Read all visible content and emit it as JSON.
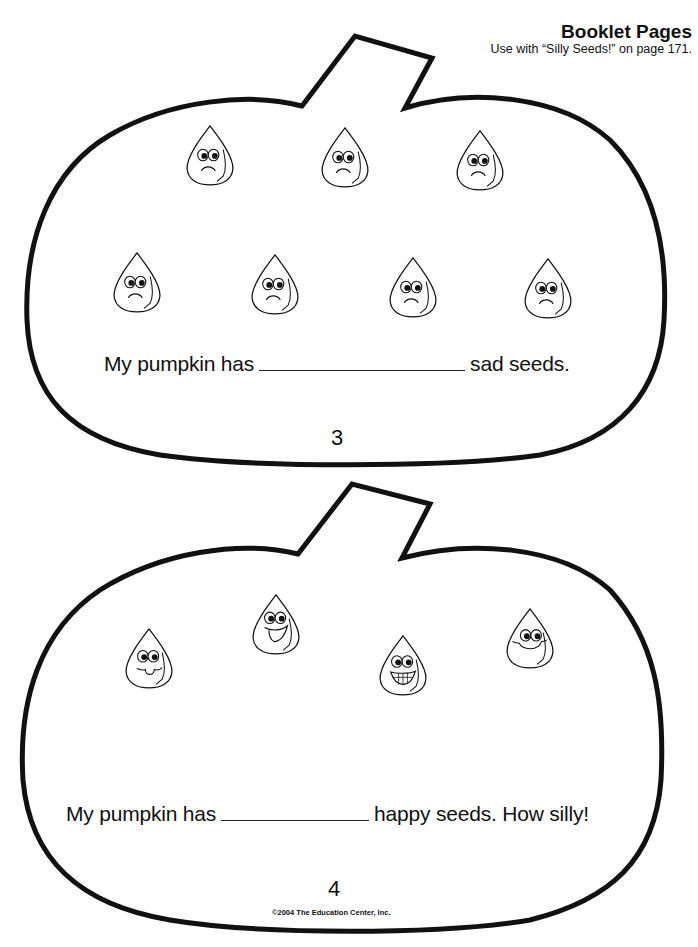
{
  "header": {
    "title": "Booklet Pages",
    "subtitle": "Use with “Silly Seeds!” on page 171."
  },
  "pages": [
    {
      "page_number": "3",
      "sentence_before": "My pumpkin has",
      "sentence_after": "sad seeds.",
      "seed_mood": "sad",
      "seed_count": 7
    },
    {
      "page_number": "4",
      "sentence_before": "My pumpkin has",
      "sentence_after": "happy seeds. How silly!",
      "seed_mood": "happy",
      "seed_count": 4
    }
  ],
  "footer": {
    "copyright": "©2004 The Education Center, Inc."
  },
  "colors": {
    "ink": "#111111",
    "paper": "#ffffff"
  }
}
